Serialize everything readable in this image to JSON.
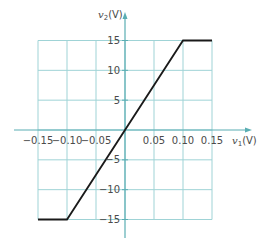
{
  "chart_data": {
    "type": "line",
    "title": "",
    "xlabel": "v1(V)",
    "ylabel": "v2(V)",
    "xlabel_parts": {
      "var": "v",
      "sub": "1",
      "unit": "(V)"
    },
    "ylabel_parts": {
      "var": "v",
      "sub": "2",
      "unit": "(V)"
    },
    "xlim": [
      -0.15,
      0.15
    ],
    "ylim": [
      -15,
      15
    ],
    "grid": true,
    "legend": null,
    "x_ticks": [
      -0.15,
      -0.1,
      -0.05,
      0.05,
      0.1,
      0.15
    ],
    "x_tick_labels": [
      "−0.15",
      "−0.10",
      "−0.05",
      "0.05",
      "0.10",
      "0.15"
    ],
    "y_ticks": [
      15,
      10,
      5,
      -5,
      -10,
      -15
    ],
    "y_tick_labels": [
      "15",
      "10",
      "5",
      "−5",
      "−10",
      "−15"
    ],
    "series": [
      {
        "name": "transfer characteristic",
        "x": [
          -0.15,
          -0.1,
          0.1,
          0.15
        ],
        "y": [
          -15,
          -15,
          15,
          15
        ]
      }
    ]
  },
  "colors": {
    "grid": "#9fd3d6",
    "axis": "#5aaeb3",
    "curve": "#1a1a1a",
    "text": "#4a4a4a"
  }
}
